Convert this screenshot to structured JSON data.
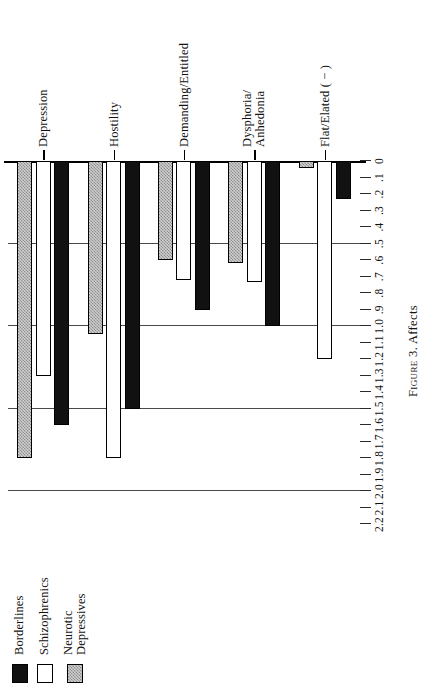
{
  "caption": {
    "figure_number": "Figure 3.",
    "title": "Affects",
    "full": "Figure 3. Affects"
  },
  "legend": {
    "items": [
      {
        "label": "Borderlines",
        "style": "solid-black",
        "color": "#111111"
      },
      {
        "label": "Schizophrenics",
        "style": "open-white",
        "color": "#ffffff"
      },
      {
        "label": "Neurotic\nDepressives",
        "style": "hatched-gray",
        "color": "#cfcfcf"
      }
    ]
  },
  "axis": {
    "tick_labels": [
      "2.2",
      "2.1",
      "2.0",
      "1.9",
      "1.8",
      "1.7",
      "1.6",
      "1.5",
      "1.4",
      "1.3",
      "1.2",
      "1.1",
      "1.0",
      ".9",
      ".8",
      ".7",
      ".6",
      ".5",
      ".4",
      ".3",
      ".2",
      ".1",
      "0"
    ],
    "tick_values": [
      2.2,
      2.1,
      2.0,
      1.9,
      1.8,
      1.7,
      1.6,
      1.5,
      1.4,
      1.3,
      1.2,
      1.1,
      1.0,
      0.9,
      0.8,
      0.7,
      0.6,
      0.5,
      0.4,
      0.3,
      0.2,
      0.1,
      0.0
    ],
    "gridline_values": [
      2.0,
      1.5,
      1.0,
      0.5
    ],
    "min": 0.0,
    "max": 2.3
  },
  "chart_data": {
    "type": "bar",
    "orientation": "horizontal",
    "title": "Figure 3. Affects",
    "xlabel": "",
    "ylabel": "",
    "xlim": [
      0.0,
      2.3
    ],
    "grid": true,
    "grid_at": [
      0.5,
      1.0,
      1.5,
      2.0
    ],
    "legend_position": "left",
    "categories": [
      "Depression",
      "Hostility",
      "Demanding/Entitled",
      "Dysphoria/\nAnhedonia",
      "Flat/Elated ( − )"
    ],
    "series": [
      {
        "name": "Borderlines",
        "style": "solid-black",
        "values": [
          1.6,
          1.5,
          0.9,
          1.0,
          0.23
        ]
      },
      {
        "name": "Schizophrenics",
        "style": "open-white",
        "values": [
          1.3,
          1.8,
          0.72,
          0.73,
          1.2
        ]
      },
      {
        "name": "Neurotic Depressives",
        "style": "hatched-gray",
        "values": [
          1.8,
          1.05,
          0.6,
          0.62,
          0.04
        ]
      }
    ]
  }
}
